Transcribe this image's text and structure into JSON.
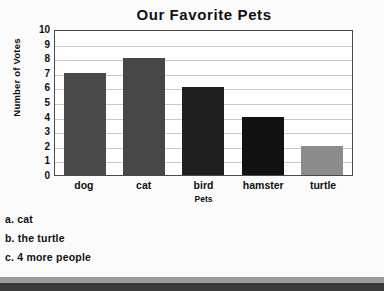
{
  "chart_data": {
    "type": "bar",
    "title": "Our Favorite Pets",
    "xlabel": "Pets",
    "ylabel": "Number of Votes",
    "categories": [
      "dog",
      "cat",
      "bird",
      "hamster",
      "turtle"
    ],
    "values": [
      7,
      8,
      6,
      4,
      2
    ],
    "bar_colors": [
      "#4a4a4a",
      "#474747",
      "#1f1f1f",
      "#121212",
      "#8c8c8c"
    ],
    "ylim": [
      0,
      10
    ],
    "yticks": [
      0,
      1,
      2,
      3,
      4,
      5,
      6,
      7,
      8,
      9,
      10
    ],
    "grid": true,
    "legend": false
  },
  "answers": [
    {
      "text": "a. cat"
    },
    {
      "text": "b. the turtle"
    },
    {
      "text": "c. 4 more people"
    }
  ],
  "colors": {
    "page_background": "#fbfbfb",
    "plot_background": "#ffffff",
    "axis_line": "#4a4a4a",
    "gridline": "#c9c9c9",
    "text": "#111111",
    "band_light": "#9a9a9a",
    "band_dark": "#3a3a3a"
  }
}
